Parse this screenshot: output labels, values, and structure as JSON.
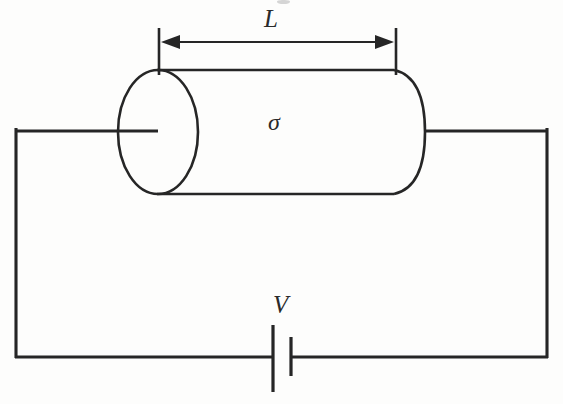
{
  "figure": {
    "kind": "physics-circuit-diagram",
    "background_color": "#fdfdfc",
    "ink_color": "#262626",
    "width": 563,
    "height": 404
  },
  "labels": {
    "length": "L",
    "conductivity": "σ",
    "voltage": "V"
  },
  "dimension": {
    "name": "length-dimension",
    "label": "L",
    "arrow_style": "double-headed",
    "x_start": 162,
    "x_end": 393,
    "y": 42,
    "extension_line_top_y": 28,
    "extension_line_bottom_y": 74
  },
  "conductor": {
    "name": "cylinder",
    "label": "σ",
    "left_face_center_x": 158,
    "left_face_center_y": 132,
    "left_face_rx": 40,
    "left_face_ry": 62,
    "body_top_y": 70,
    "body_bottom_y": 194,
    "body_right_x": 393,
    "right_cap_bulge_x": 425
  },
  "circuit": {
    "name": "circuit-loop",
    "left_x": 15,
    "right_x": 548,
    "top_y": 128,
    "bottom_y": 358,
    "left_lead_end_x": 158,
    "right_lead_start_x": 425
  },
  "battery": {
    "name": "battery-symbol",
    "label": "V",
    "long_plate_x": 272,
    "long_plate_top_y": 325,
    "long_plate_bottom_y": 392,
    "short_plate_x": 292,
    "short_plate_top_y": 337,
    "short_plate_bottom_y": 376,
    "wire_y": 358
  }
}
